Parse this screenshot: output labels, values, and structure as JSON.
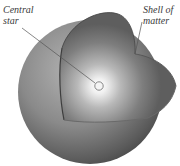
{
  "diagram": {
    "type": "cutaway-sphere",
    "labels": {
      "central_star": [
        "Central",
        "star"
      ],
      "shell": [
        "Shell of",
        "matter"
      ]
    },
    "colors": {
      "background": "#ffffff",
      "sphere_outer": "#5a5a5a",
      "sphere_highlight": "#a8a8a8",
      "interior_glow": "#f4f4f4",
      "interior_dark": "#6b6b6b",
      "leader_line": "#4a4a4a"
    }
  }
}
